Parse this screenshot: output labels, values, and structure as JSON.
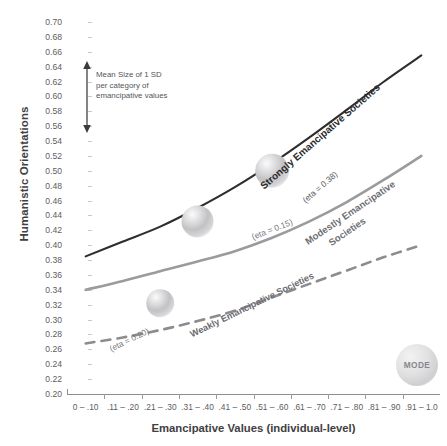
{
  "chart_data": {
    "type": "line",
    "title": "",
    "xlabel": "Emancipative Values (individual-level)",
    "ylabel": "Humanistic Orientations",
    "categories": [
      "0 – .10",
      ".11 – .20",
      ".21 – .30",
      ".31 – .40",
      ".41 – .50",
      ".51 – .60",
      ".61 – .70",
      ".71 – .80",
      ".81 – .90",
      ".91 – 1.0"
    ],
    "ylim": [
      0.2,
      0.7
    ],
    "ytick_step": 0.02,
    "yticks": [
      "0.70",
      "0.68",
      "0.66",
      "0.64",
      "0.62",
      "0.60",
      "0.58",
      "0.56",
      "0.54",
      "0.52",
      "0.50",
      "0.48",
      "0.46",
      "0.44",
      "0.42",
      "0.40",
      "0.38",
      "0.36",
      "0.34",
      "0.32",
      "0.30",
      "0.28",
      "0.26",
      "0.24",
      "0.22",
      "0.20"
    ],
    "grid": false,
    "legend_position": "inline-curve-labels",
    "series": [
      {
        "name": "Strongly Emancipative Societies",
        "eta_label": "(eta = 0.38)",
        "eta": 0.38,
        "style": "solid",
        "color": "#2e2e30",
        "values": [
          0.385,
          0.405,
          0.425,
          0.45,
          0.478,
          0.51,
          0.545,
          0.582,
          0.62,
          0.655
        ]
      },
      {
        "name": "Modestly Emancipative Societies",
        "eta_label": "(eta = 0.15)",
        "eta": 0.15,
        "style": "solid",
        "color": "#9b9b9e",
        "values": [
          0.34,
          0.352,
          0.365,
          0.378,
          0.392,
          0.41,
          0.432,
          0.458,
          0.488,
          0.52
        ]
      },
      {
        "name": "Weakly Emancipative Societies",
        "eta_label": "(eta = 0.20)",
        "eta": 0.2,
        "style": "dashed",
        "color": "#8c8c90",
        "values": [
          0.268,
          0.276,
          0.286,
          0.298,
          0.312,
          0.33,
          0.348,
          0.366,
          0.384,
          0.4
        ]
      }
    ],
    "bubbles": [
      {
        "label": "mean-sd-weakly",
        "x_category": ".21 – .30",
        "y": 0.322,
        "radius_px": 14
      },
      {
        "label": "mean-sd-modestly",
        "x_category": ".31 – .40",
        "y": 0.432,
        "radius_px": 16
      },
      {
        "label": "mean-sd-strongly",
        "x_category": ".51 – .60",
        "y": 0.5,
        "radius_px": 17
      }
    ],
    "annotations": [
      {
        "name": "mean-sd-arrow-note",
        "lines": [
          "Mean Size of 1 SD",
          "per category of",
          "emancipative values"
        ],
        "arrow": "double-vertical",
        "arrow_span_y": [
          0.505,
          0.635
        ]
      }
    ],
    "watermark": {
      "text": "MODE"
    }
  },
  "axis": {
    "y_title": "Humanistic Orientations",
    "x_title": "Emancipative Values (individual-level)"
  },
  "labels": {
    "strongly": "Strongly Emancipative Societies",
    "strongly_eta": "(eta = 0.38)",
    "modestly_line1": "Modestly Emancipative",
    "modestly_line2": "Societies",
    "modestly_eta": "(eta = 0.15)",
    "weakly": "Weakly Emancipative Societies",
    "weakly_eta": "(eta = 0.20)"
  },
  "annotation": {
    "line1": "Mean Size of 1 SD",
    "line2": "per category of",
    "line3": "emancipative values"
  },
  "watermark": {
    "text": "MODE"
  }
}
